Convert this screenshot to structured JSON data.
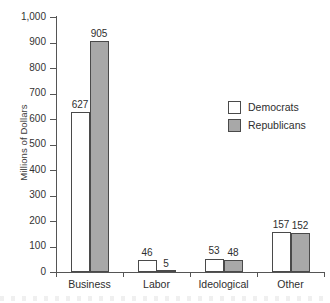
{
  "chart_data": {
    "type": "bar",
    "title": "",
    "subtitle": "",
    "xlabel": "",
    "ylabel": "Millions of Dollars",
    "categories": [
      "Business",
      "Labor",
      "Ideological",
      "Other"
    ],
    "series": [
      {
        "name": "Democrats",
        "color": "#ffffff",
        "values": [
          627,
          46,
          53,
          157
        ]
      },
      {
        "name": "Republicans",
        "color": "#a8a8a8",
        "values": [
          905,
          5,
          48,
          152
        ]
      }
    ],
    "ylim": [
      0,
      1000
    ],
    "ytick_values": [
      0,
      100,
      200,
      300,
      400,
      500,
      600,
      700,
      800,
      900,
      1000
    ],
    "ytick_labels": [
      "0",
      "100",
      "200",
      "300",
      "400",
      "500",
      "600",
      "700",
      "800",
      "900",
      "1,000"
    ],
    "grid": false,
    "legend_position": "upper-right",
    "data_labels": true,
    "data_label_values": [
      [
        "627",
        "905"
      ],
      [
        "46",
        "5"
      ],
      [
        "53",
        "48"
      ],
      [
        "157",
        "152"
      ]
    ],
    "annotations": []
  },
  "legend": {
    "entries": [
      {
        "label": "Democrats",
        "swatch": "white-square-swatch"
      },
      {
        "label": "Republicans",
        "swatch": "gray-square-swatch"
      }
    ]
  }
}
